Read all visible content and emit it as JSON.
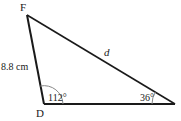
{
  "diagram": {
    "type": "triangle",
    "vertices": {
      "F": {
        "label": "F"
      },
      "D": {
        "label": "D"
      },
      "E": {
        "label": ""
      }
    },
    "sides": {
      "FD": {
        "label": "8.8 cm"
      },
      "FE": {
        "label": "d"
      }
    },
    "angles": {
      "D": {
        "label": "112°"
      },
      "E": {
        "label": "36°"
      }
    },
    "colors": {
      "line": "#1a1a1a",
      "arc": "#888888"
    }
  }
}
